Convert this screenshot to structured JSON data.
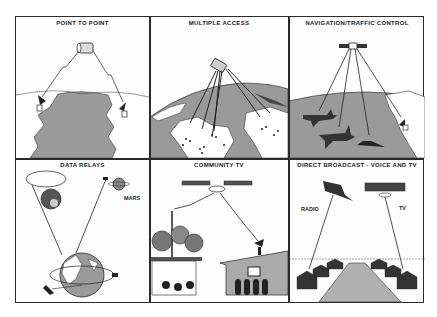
{
  "figure": {
    "layout": "2 rows x 3 columns",
    "colors": {
      "frame": "#2a2a2a",
      "land_gray": "#9a9a9a",
      "sea_white": "#ffffff",
      "ink": "#1e1e1e"
    },
    "panels": [
      {
        "id": "point-to-point",
        "title": "POINT TO POINT"
      },
      {
        "id": "multiple-access",
        "title": "MULTIPLE ACCESS"
      },
      {
        "id": "navigation-traffic-control",
        "title": "NAVIGATION/TRAFFIC CONTROL"
      },
      {
        "id": "data-relays",
        "title": "DATA RELAYS",
        "labels": {
          "planet": "MARS"
        }
      },
      {
        "id": "community-tv",
        "title": "COMMUNITY TV"
      },
      {
        "id": "direct-broadcast",
        "title": "DIRECT BROADCAST - VOICE AND TV",
        "labels": {
          "left": "RADIO",
          "right": "TV"
        }
      }
    ]
  }
}
